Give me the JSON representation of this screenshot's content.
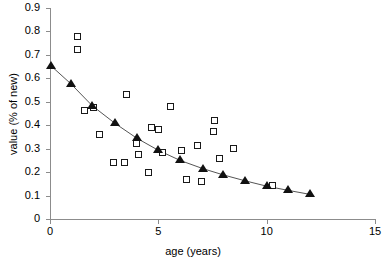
{
  "chart_data": {
    "type": "scatter",
    "title": "",
    "xlabel": "age (years)",
    "ylabel": "value (% of new)",
    "xlim": [
      0,
      15
    ],
    "ylim": [
      0,
      0.9
    ],
    "xticks": [
      0,
      5,
      10,
      15
    ],
    "xtick_labels": [
      "0",
      "5",
      "10",
      "15"
    ],
    "yticks": [
      0,
      0.1,
      0.2,
      0.3,
      0.4,
      0.5,
      0.6,
      0.7,
      0.8,
      0.9
    ],
    "ytick_labels": [
      "0",
      "0.1",
      "0.2",
      "0.3",
      "0.4",
      "0.5",
      "0.6",
      "0.7",
      "0.8",
      "0.9"
    ],
    "grid": false,
    "legend": "none",
    "series": [
      {
        "name": "observed values",
        "marker": "open-square",
        "color": "#1a1a1a",
        "points": [
          {
            "x": 1.3,
            "y": 0.776
          },
          {
            "x": 1.3,
            "y": 0.721
          },
          {
            "x": 1.6,
            "y": 0.462
          },
          {
            "x": 2.05,
            "y": 0.475
          },
          {
            "x": 2.3,
            "y": 0.358
          },
          {
            "x": 2.95,
            "y": 0.24
          },
          {
            "x": 3.45,
            "y": 0.24
          },
          {
            "x": 3.55,
            "y": 0.53
          },
          {
            "x": 4.0,
            "y": 0.32
          },
          {
            "x": 4.1,
            "y": 0.272
          },
          {
            "x": 4.55,
            "y": 0.196
          },
          {
            "x": 4.7,
            "y": 0.388
          },
          {
            "x": 5.05,
            "y": 0.378
          },
          {
            "x": 5.2,
            "y": 0.283
          },
          {
            "x": 5.6,
            "y": 0.478
          },
          {
            "x": 6.1,
            "y": 0.288
          },
          {
            "x": 6.3,
            "y": 0.168
          },
          {
            "x": 6.85,
            "y": 0.31
          },
          {
            "x": 7.0,
            "y": 0.158
          },
          {
            "x": 7.55,
            "y": 0.37
          },
          {
            "x": 7.6,
            "y": 0.42
          },
          {
            "x": 7.85,
            "y": 0.258
          },
          {
            "x": 8.5,
            "y": 0.3
          },
          {
            "x": 10.3,
            "y": 0.14
          }
        ]
      },
      {
        "name": "fitted trend",
        "marker": "filled-triangle",
        "color": "#111111",
        "line": true,
        "points": [
          {
            "x": 0.05,
            "y": 0.653
          },
          {
            "x": 0.97,
            "y": 0.576
          },
          {
            "x": 1.95,
            "y": 0.483
          },
          {
            "x": 3.0,
            "y": 0.408
          },
          {
            "x": 4.0,
            "y": 0.345
          },
          {
            "x": 5.0,
            "y": 0.293
          },
          {
            "x": 6.0,
            "y": 0.25
          },
          {
            "x": 7.05,
            "y": 0.215
          },
          {
            "x": 8.0,
            "y": 0.188
          },
          {
            "x": 9.0,
            "y": 0.163
          },
          {
            "x": 10.0,
            "y": 0.14
          },
          {
            "x": 11.0,
            "y": 0.122
          },
          {
            "x": 12.0,
            "y": 0.105
          }
        ]
      }
    ]
  }
}
